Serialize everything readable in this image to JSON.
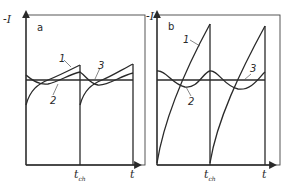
{
  "figure": {
    "panels": [
      {
        "id": "a",
        "panel_label": "a",
        "y_axis_label": "-I",
        "x_axis_label": "t",
        "t_mark_label": "t",
        "t_mark_sub": "ch",
        "curve_labels": [
          "1",
          "2",
          "3"
        ]
      },
      {
        "id": "b",
        "panel_label": "b",
        "y_axis_label": "-I",
        "x_axis_label": "t",
        "t_mark_label": "t",
        "t_mark_sub": "ch",
        "curve_labels": [
          "1",
          "2",
          "3"
        ]
      }
    ]
  }
}
